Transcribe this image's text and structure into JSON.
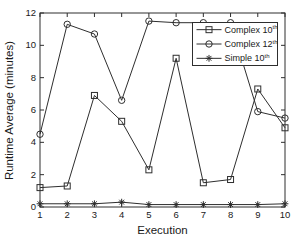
{
  "colors": {
    "line": "#2e2e2e",
    "text": "#1a1a1a",
    "background": "#ffffff"
  },
  "chart_data": {
    "type": "line",
    "title": "",
    "xlabel": "Execution",
    "ylabel": "Runtime Average (minutes)",
    "x": [
      1,
      2,
      3,
      4,
      5,
      6,
      7,
      8,
      9,
      10
    ],
    "xlim": [
      1,
      10
    ],
    "ylim": [
      0,
      12
    ],
    "xticks": [
      1,
      2,
      3,
      4,
      5,
      6,
      7,
      8,
      9,
      10
    ],
    "yticks": [
      0,
      2,
      4,
      6,
      8,
      10,
      12
    ],
    "grid": false,
    "legend_position": "top-right",
    "series": [
      {
        "name": "Complex 10",
        "name_sup": "th",
        "marker": "square",
        "values": [
          1.2,
          1.3,
          6.9,
          5.3,
          2.3,
          9.2,
          1.5,
          1.7,
          7.3,
          4.9
        ]
      },
      {
        "name": "Complex 12",
        "name_sup": "th",
        "marker": "circle",
        "values": [
          4.5,
          11.3,
          10.7,
          6.6,
          11.5,
          11.4,
          11.4,
          11.4,
          5.9,
          5.5
        ]
      },
      {
        "name": "Simple 10",
        "name_sup": "th",
        "marker": "asterisk",
        "values": [
          0.2,
          0.2,
          0.2,
          0.3,
          0.15,
          0.15,
          0.15,
          0.15,
          0.15,
          0.2
        ]
      }
    ]
  }
}
